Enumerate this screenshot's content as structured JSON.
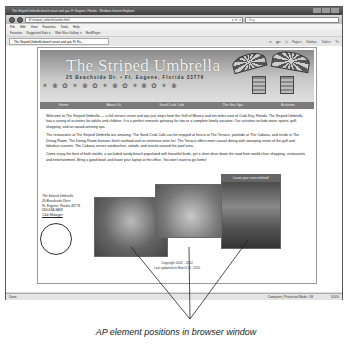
{
  "browser": {
    "window_title": "The Striped Umbrella beach resort and spa, Ft. Eugene, Florida - Windows Internet Explorer",
    "address": "E:\\striped_umbrella\\index.html",
    "search_placeholder": "Bing",
    "menu": [
      "File",
      "Edit",
      "View",
      "Favorites",
      "Tools",
      "Help"
    ],
    "favorites_bar": [
      "Favorites",
      "Suggested Sites ▾",
      "Web Slice Gallery ▾",
      "RealPlayer"
    ],
    "tab_title": "The Striped Umbrella beach resort and spa, Ft. Eu...",
    "command_bar": [
      "Page ▾",
      "Safety ▾",
      "Tools ▾"
    ],
    "status_left": "Done",
    "status_zone": "Computer | Protected Mode: Off",
    "zoom": "100%"
  },
  "site": {
    "title": "The Striped Umbrella",
    "address_line": "25 Beachside Dr. • Ft. Eugene, Florida 33776",
    "nav": [
      "Home",
      "About Us",
      "Sand Crab Cafe",
      "The Sea Spa",
      "Activities"
    ],
    "paragraphs": [
      "Welcome to The Striped Umbrella — a full-service resort and spa just steps from the Gulf of Mexico and ten miles east of Crab Key, Florida. The Striped Umbrella has a variety of activities for adults and children. It is a perfect romantic getaway for two or a complete family vacation. Our activities include water sports, golf, shopping, and an award-winning spa.",
      "The restaurants at The Striped Umbrella are amazing. The Sand Crab Cafe can be enjoyed al fresco at The Terrace, poolside at The Cabana, and inside in The Dining Room. The Dining Room features fresh seafood and an extensive wine list. The Terrace offers more casual dining with sweeping views of the gulf and fabulous sunsets. The Cabana serves sandwiches, salads, and snacks around the pool area.",
      "Come enjoy the best of both worlds, a secluded sandy beach populated with beautiful birds, yet a short drive down the road from world-class shopping, restaurants, and entertainment. Bring a good book and leave your laptop at the office. You won't want to go home!"
    ],
    "contact": {
      "name": "The Striped Umbrella",
      "street": "25 Beachside Drive",
      "city": "Ft. Eugene, Florida 33776",
      "phone": "555-594-9458",
      "link": "Club Manager"
    },
    "photo_caption": "Leave your cares behind!",
    "footer": [
      "Copyright 2002 - 2012",
      "Last updated on March 21, 2010"
    ]
  },
  "annotation": "AP element positions in browser window"
}
